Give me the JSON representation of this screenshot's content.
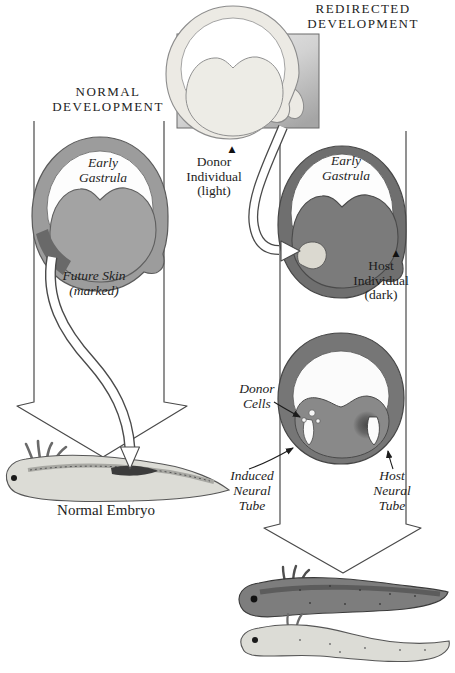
{
  "columns": {
    "normal": {
      "heading": [
        "NORMAL",
        "DEVELOPMENT"
      ],
      "gastrula_label": [
        "Early",
        "Gastrula"
      ],
      "future_skin_label": [
        "Future Skin",
        "(marked)"
      ],
      "embryo_caption": "Normal Embryo"
    },
    "redirected": {
      "heading": [
        "REDIRECTED",
        "DEVELOPMENT"
      ],
      "donor_label": [
        "Donor",
        "Individual",
        "(light)"
      ],
      "gastrula_label": [
        "Early",
        "Gastrula"
      ],
      "host_label": [
        "Host",
        "Individual",
        "(dark)"
      ],
      "donor_cells_label": [
        "Donor",
        "Cells"
      ],
      "induced_tube_label": [
        "Induced",
        "Neural",
        "Tube"
      ],
      "host_tube_label": [
        "Host",
        "Neural",
        "Tube"
      ]
    }
  },
  "icons": {
    "pointer_up": "▲"
  },
  "colors": {
    "background": "#ffffff",
    "text": "#1d1d1d",
    "outline": "#4a4a4a",
    "normal_gastrula_ring": "#9c9c9c",
    "normal_gastrula_mass": "#a3a3a3",
    "marked_patch": "#696969",
    "donor_gastrula_ring": "#eceae4",
    "donor_gastrula_mass": "#edece6",
    "donor_square_light": "#efefef",
    "donor_square_dark": "#a5a5a5",
    "host_gastrula_ring": "#6f6f6f",
    "host_gastrula_mass": "#7b7b7b",
    "graft_patch": "#dbd9d0",
    "neurula_ring": "#767676",
    "neurula_mass": "#898989",
    "embryo_light": "#dcdcd6",
    "embryo_dark": "#7d7d7d",
    "arrow_fill": "#ffffff"
  }
}
